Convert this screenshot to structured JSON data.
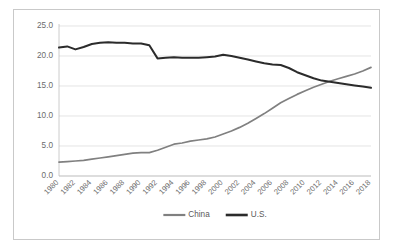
{
  "chart_data": {
    "type": "line",
    "title": "",
    "subtitle": "",
    "xlabel": "",
    "ylabel": "",
    "ylim": [
      0.0,
      25.0
    ],
    "yticks": [
      "0.0",
      "5.0",
      "10.0",
      "15.0",
      "20.0",
      "25.0"
    ],
    "ytick_values": [
      0.0,
      5.0,
      10.0,
      15.0,
      20.0,
      25.0
    ],
    "grid": true,
    "legend_position": "bottom",
    "x": [
      1980,
      1981,
      1982,
      1983,
      1984,
      1985,
      1986,
      1987,
      1988,
      1989,
      1990,
      1991,
      1992,
      1993,
      1994,
      1995,
      1996,
      1997,
      1998,
      1999,
      2000,
      2001,
      2002,
      2003,
      2004,
      2005,
      2006,
      2007,
      2008,
      2009,
      2010,
      2011,
      2012,
      2013,
      2014,
      2015,
      2016,
      2017,
      2018
    ],
    "xticks": [
      "1980",
      "1982",
      "1984",
      "1986",
      "1988",
      "1990",
      "1992",
      "1994",
      "1996",
      "1998",
      "2000",
      "2002",
      "2004",
      "2006",
      "2008",
      "2010",
      "2012",
      "2014",
      "2016",
      "2018"
    ],
    "xtick_values": [
      1980,
      1982,
      1984,
      1986,
      1988,
      1990,
      1992,
      1994,
      1996,
      1998,
      2000,
      2002,
      2004,
      2006,
      2008,
      2010,
      2012,
      2014,
      2016,
      2018
    ],
    "series": [
      {
        "name": "China",
        "color": "#808080",
        "values": [
          2.3,
          2.4,
          2.5,
          2.6,
          2.8,
          3.0,
          3.2,
          3.4,
          3.6,
          3.8,
          3.9,
          3.9,
          4.3,
          4.8,
          5.3,
          5.5,
          5.8,
          6.0,
          6.2,
          6.5,
          7.0,
          7.5,
          8.1,
          8.8,
          9.6,
          10.4,
          11.3,
          12.2,
          12.9,
          13.6,
          14.2,
          14.8,
          15.3,
          15.8,
          16.2,
          16.6,
          17.0,
          17.5,
          18.1
        ]
      },
      {
        "name": "U.S.",
        "color": "#2b2b2b",
        "values": [
          21.4,
          21.6,
          21.1,
          21.5,
          22.0,
          22.2,
          22.3,
          22.2,
          22.2,
          22.1,
          22.1,
          21.8,
          19.6,
          19.7,
          19.8,
          19.7,
          19.7,
          19.7,
          19.8,
          19.9,
          20.2,
          20.0,
          19.7,
          19.4,
          19.1,
          18.8,
          18.6,
          18.5,
          18.0,
          17.3,
          16.8,
          16.3,
          15.9,
          15.7,
          15.5,
          15.3,
          15.1,
          14.9,
          14.7
        ]
      }
    ],
    "legend": [
      {
        "label": "China",
        "color": "#808080"
      },
      {
        "label": "U.S.",
        "color": "#2b2b2b"
      }
    ]
  }
}
